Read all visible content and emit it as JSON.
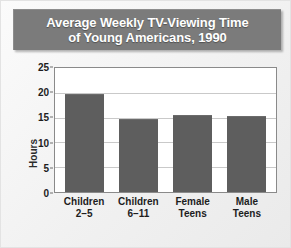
{
  "chart_data": {
    "type": "bar",
    "title": "Average Weekly TV-Viewing Time of Young Americans, 1990",
    "title_lines": [
      "Average Weekly TV-Viewing Time",
      "of Young Americans, 1990"
    ],
    "categories": [
      "Children 2–5",
      "Children 6–11",
      "Female Teens",
      "Male Teens"
    ],
    "category_lines": [
      [
        "Children",
        "2–5"
      ],
      [
        "Children",
        "6–11"
      ],
      [
        "Female",
        "Teens"
      ],
      [
        "Male",
        "Teens"
      ]
    ],
    "values": [
      19.7,
      14.7,
      15.6,
      15.4
    ],
    "xlabel": "",
    "ylabel": "Hours",
    "ylim": [
      0,
      25
    ],
    "yticks": [
      0,
      5,
      10,
      15,
      20,
      25
    ],
    "ytick_labels": [
      "0",
      "5",
      "10",
      "15",
      "20",
      "25"
    ],
    "grid": true,
    "legend": false,
    "colors": {
      "bar": "#5e5e5e",
      "title_banner": "#7b7b7b",
      "title_text": "#ffffff",
      "plot_background": "#ffffff",
      "gridline": "#c9c9c9",
      "plot_border": "#8a8a8a",
      "figure_background": "#f1f1f1",
      "tick_text": "#1d1d1d"
    }
  }
}
